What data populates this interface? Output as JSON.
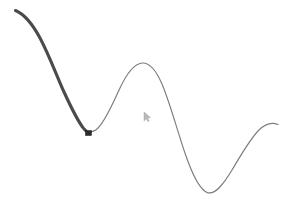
{
  "canvas": {
    "name": "drawing-canvas",
    "width": 288,
    "height": 203,
    "background_color": "#ffffff",
    "label": "Curve drawing canvas"
  },
  "strokes": [
    {
      "name": "selected-stroke-segment",
      "role": "highlighted-segment",
      "color": "#4a4a4a",
      "width": 3.1,
      "linecap": "round",
      "linejoin": "round",
      "opacity": 1,
      "path": "M 15.5 10.5 C 25 14.5 33 25 40 38 C 49 55 56 74 64 92 C 70 105 76 118 82.5 127 C 84 129.2 85 130.2 86 130.8",
      "label": "Thick dark selected portion of curve"
    },
    {
      "name": "unselected-stroke-segment",
      "role": "base-curve",
      "color": "#7c7c7c",
      "width": 1.15,
      "linecap": "round",
      "linejoin": "round",
      "opacity": 1,
      "path": "M 86 130.8 C 90 133 94 132 98 128 C 106 120 112 105 120 88 C 127 73 134 64 142 63 C 150 62.4 156 70 162 84 C 170 103 178 133 186 156 C 193 176 200 190 207.5 192.6 C 215 195 223 185 232 170 C 241 155 250 139 259 130 C 266 123 272 122 278 124.5",
      "label": "Thin gray remainder of curve"
    }
  ],
  "handles": [
    {
      "name": "anchor-point-handle",
      "shape": "square",
      "x": 85.5,
      "y": 130.5,
      "width": 6,
      "height": 5,
      "fill": "#2b2b2b",
      "stroke": "#1a1a1a",
      "label": "Selection anchor handle at end of highlighted segment"
    }
  ],
  "cursor": {
    "name": "mouse-cursor",
    "type": "arrow-pointer",
    "x": 144,
    "y": 112,
    "width": 6,
    "height": 9,
    "fill": "#b9b9b9",
    "stroke": "#9a9a9a",
    "label": "Faint arrow cursor"
  },
  "accessibility": {
    "canvas_description": "A smooth sinusoidal curve drawn left to right; the left segment is thick and dark indicating selection, terminating at a small square anchor handle near the first trough.",
    "stroke_selected_label": "Selected segment",
    "stroke_unselected_label": "Unselected segment",
    "handle_label": "Anchor handle",
    "cursor_label": "Pointer"
  }
}
